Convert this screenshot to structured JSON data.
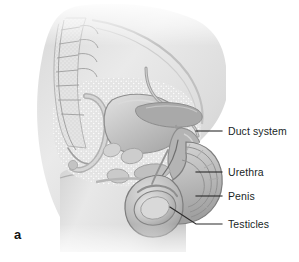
{
  "figure": {
    "panel_letter": "a",
    "background_color": "#ffffff",
    "line_color": "#2b2a2a",
    "text_color": "#201f1f",
    "tissue_tones": {
      "lightest": "#f2f2f2",
      "light": "#e2e2e2",
      "mid": "#cfcfcf",
      "mid_dark": "#b8b8b8",
      "dark": "#a3a3a3",
      "darkest": "#8e8e8e"
    }
  },
  "labels": [
    {
      "id": "duct-system",
      "text": "Duct system",
      "text_x": 228,
      "text_y": 125,
      "leader": {
        "x1": 196,
        "y1": 131,
        "x2": 222,
        "y2": 131
      }
    },
    {
      "id": "urethra",
      "text": "Urethra",
      "text_x": 228,
      "text_y": 166,
      "leader": {
        "x1": 196,
        "y1": 172,
        "x2": 222,
        "y2": 172
      }
    },
    {
      "id": "penis",
      "text": "Penis",
      "text_x": 228,
      "text_y": 190,
      "leader": {
        "x1": 196,
        "y1": 196,
        "x2": 222,
        "y2": 196
      }
    },
    {
      "id": "testicles",
      "text": "Testicles",
      "text_x": 228,
      "text_y": 218,
      "leader_path": "M 222 224 L 196 224 L 172 208"
    }
  ]
}
